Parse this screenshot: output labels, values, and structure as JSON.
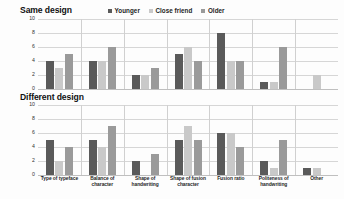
{
  "legend": {
    "items": [
      {
        "label": "Younger",
        "color": "#5a5a5a",
        "icon": "square-swatch-icon"
      },
      {
        "label": "Close friend",
        "color": "#c9c9c9",
        "icon": "square-swatch-icon"
      },
      {
        "label": "Older",
        "color": "#9a9a9a",
        "icon": "square-swatch-icon"
      }
    ]
  },
  "chart_data": [
    {
      "type": "bar",
      "title": "Same design",
      "xlabel": "",
      "ylabel": "",
      "ylim": [
        0,
        10
      ],
      "yticks": [
        10,
        8,
        6,
        4,
        2,
        0
      ],
      "grid": true,
      "legend_position": "top-center",
      "categories": [
        "Type of typeface",
        "Balance of character",
        "Shape of handwriting",
        "Shape of fusion character",
        "Fusion ratio",
        "Politeness of handwriting",
        "Other"
      ],
      "series": [
        {
          "name": "Younger",
          "color": "#5a5a5a",
          "values": [
            4,
            4,
            2,
            5,
            8,
            1,
            0
          ]
        },
        {
          "name": "Close friend",
          "color": "#c9c9c9",
          "values": [
            3,
            4,
            2,
            6,
            4,
            1,
            2
          ]
        },
        {
          "name": "Older",
          "color": "#9a9a9a",
          "values": [
            5,
            6,
            3,
            4,
            4,
            6,
            0
          ]
        }
      ]
    },
    {
      "type": "bar",
      "title": "Different design",
      "xlabel": "",
      "ylabel": "",
      "ylim": [
        0,
        10
      ],
      "yticks": [
        10,
        8,
        6,
        4,
        2,
        0
      ],
      "grid": true,
      "legend_position": "top-center",
      "categories": [
        "Type of typeface",
        "Balance of character",
        "Shape of handwriting",
        "Shape of fusion character",
        "Fusion ratio",
        "Politeness of handwriting",
        "Other"
      ],
      "series": [
        {
          "name": "Younger",
          "color": "#5a5a5a",
          "values": [
            5,
            5,
            2,
            5,
            6,
            2,
            1
          ]
        },
        {
          "name": "Close friend",
          "color": "#c9c9c9",
          "values": [
            2,
            4,
            0,
            7,
            6,
            1,
            1
          ]
        },
        {
          "name": "Older",
          "color": "#9a9a9a",
          "values": [
            4,
            7,
            3,
            5,
            4,
            5,
            0
          ]
        }
      ]
    }
  ],
  "xaxis": {
    "labels": [
      "Type of typeface",
      "Balance of character",
      "Shape of handwriting",
      "Shape of fusion character",
      "Fusion ratio",
      "Politeness of handwriting",
      "Other"
    ]
  }
}
